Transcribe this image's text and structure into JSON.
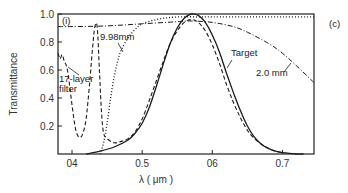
{
  "chart_data": {
    "type": "line",
    "title": "",
    "panel_label": "(c)",
    "inset_label": "(i)",
    "xlabel": "λ ( μm )",
    "ylabel": "Transmittance",
    "xlim": [
      0.38,
      0.745
    ],
    "ylim": [
      0,
      1.0
    ],
    "x_ticks": [
      "0.4",
      "0.5",
      "0.6",
      "0.7"
    ],
    "x_tick_labels": [
      "04",
      "0.5",
      "06",
      "0.7"
    ],
    "y_ticks": [
      "0.2",
      "0.4",
      "0.6",
      "0.8",
      "1.0"
    ],
    "y_tick_labels": [
      "0.2",
      "0.4",
      "0.6",
      "0.8",
      "1.0"
    ],
    "grid": false,
    "legend": "none (curves annotated directly)",
    "series": [
      {
        "name": "Target",
        "style": "solid",
        "x": [
          0.42,
          0.44,
          0.46,
          0.48,
          0.49,
          0.5,
          0.51,
          0.52,
          0.53,
          0.54,
          0.55,
          0.56,
          0.57,
          0.58,
          0.59,
          0.6,
          0.61,
          0.62,
          0.63,
          0.64,
          0.65,
          0.66,
          0.67,
          0.68,
          0.69,
          0.7,
          0.71,
          0.72,
          0.73
        ],
        "y": [
          0.0,
          0.02,
          0.05,
          0.1,
          0.15,
          0.22,
          0.33,
          0.48,
          0.64,
          0.79,
          0.9,
          0.97,
          1.0,
          0.99,
          0.94,
          0.85,
          0.73,
          0.58,
          0.44,
          0.31,
          0.2,
          0.12,
          0.07,
          0.04,
          0.02,
          0.01,
          0.005,
          0.0,
          0.0
        ]
      },
      {
        "name": "17-layer filter",
        "style": "dashed",
        "x": [
          0.38,
          0.383,
          0.386,
          0.389,
          0.392,
          0.395,
          0.4,
          0.405,
          0.41,
          0.415,
          0.42,
          0.425,
          0.43,
          0.433,
          0.436,
          0.439,
          0.442,
          0.445,
          0.45,
          0.46,
          0.47,
          0.48,
          0.49,
          0.5,
          0.51,
          0.52,
          0.53,
          0.54,
          0.55,
          0.56,
          0.57,
          0.58,
          0.59,
          0.6,
          0.61,
          0.62,
          0.63,
          0.64,
          0.65,
          0.66,
          0.67,
          0.68,
          0.69,
          0.7
        ],
        "y": [
          0.72,
          0.68,
          0.71,
          0.66,
          0.63,
          0.55,
          0.35,
          0.18,
          0.12,
          0.14,
          0.25,
          0.5,
          0.8,
          0.92,
          0.9,
          0.6,
          0.3,
          0.15,
          0.11,
          0.08,
          0.09,
          0.11,
          0.16,
          0.25,
          0.38,
          0.52,
          0.66,
          0.79,
          0.88,
          0.94,
          0.96,
          0.94,
          0.88,
          0.78,
          0.65,
          0.5,
          0.37,
          0.26,
          0.17,
          0.11,
          0.07,
          0.04,
          0.02,
          0.01
        ]
      },
      {
        "name": "9.98 mm",
        "style": "dotted",
        "x": [
          0.44,
          0.445,
          0.45,
          0.455,
          0.46,
          0.465,
          0.47,
          0.48,
          0.49,
          0.5,
          0.52,
          0.54,
          0.56,
          0.58,
          0.6,
          0.65,
          0.7,
          0.745
        ],
        "y": [
          0.0,
          0.08,
          0.22,
          0.4,
          0.55,
          0.66,
          0.74,
          0.83,
          0.89,
          0.93,
          0.96,
          0.975,
          0.98,
          0.98,
          0.98,
          0.98,
          0.98,
          0.98
        ]
      },
      {
        "name": "2.0 mm",
        "style": "dash-dot",
        "x": [
          0.38,
          0.4,
          0.45,
          0.5,
          0.55,
          0.57,
          0.6,
          0.63,
          0.65,
          0.68,
          0.7,
          0.72,
          0.745
        ],
        "y": [
          0.91,
          0.91,
          0.915,
          0.93,
          0.945,
          0.95,
          0.94,
          0.91,
          0.87,
          0.79,
          0.72,
          0.63,
          0.51
        ]
      }
    ],
    "annotations": [
      {
        "text": "(i)",
        "x": 0.385,
        "y": 0.93
      },
      {
        "text": "9.98mm",
        "x": 0.465,
        "y": 0.8,
        "points_to": "9.98 mm"
      },
      {
        "text": "17-layer",
        "x": 0.382,
        "y": 0.52,
        "points_to": "17-layer filter"
      },
      {
        "text": "filter",
        "x": 0.382,
        "y": 0.44
      },
      {
        "text": "Target",
        "x": 0.605,
        "y": 0.67,
        "points_to": "Target"
      },
      {
        "text": "2.0 mm",
        "x": 0.655,
        "y": 0.51,
        "points_to": "2.0 mm"
      },
      {
        "text": "(c)",
        "x": 0.755,
        "y": 0.93
      }
    ]
  },
  "labels": {
    "ylabel": "Transmittance",
    "xlabel": "λ ( μm )",
    "panel": "(c)",
    "inset": "(i)",
    "ann_998": "9.98mm",
    "ann_17a": "17-layer",
    "ann_17b": "filter",
    "ann_target": "Target",
    "ann_20": "2.0 mm"
  }
}
